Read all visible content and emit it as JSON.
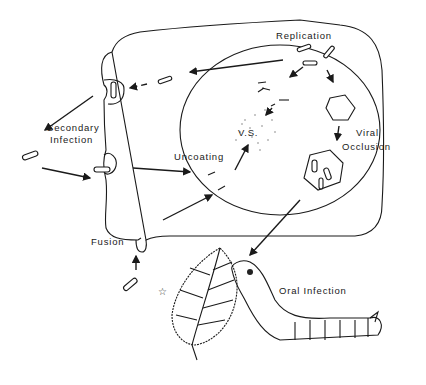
{
  "diagram": {
    "type": "biological-cycle",
    "labels": {
      "replication": "Replication",
      "secondary_infection_1": "Secondary",
      "secondary_infection_2": "Infection",
      "uncoating": "Uncoating",
      "virogenic_stroma": "V.S.",
      "viral_occlusion_1": "Viral",
      "viral_occlusion_2": "Occlusion",
      "fusion": "Fusion",
      "oral_infection": "Oral Infection"
    },
    "nodes": [
      {
        "id": "cell",
        "description": "Host cell outline"
      },
      {
        "id": "nucleus",
        "description": "Nucleus (circle)"
      },
      {
        "id": "vs",
        "description": "Virogenic stroma (stippled)"
      },
      {
        "id": "occlusion-small",
        "description": "Developing occlusion body"
      },
      {
        "id": "occlusion-large",
        "description": "Polyhedral occlusion body with virions"
      },
      {
        "id": "leaf",
        "description": "Leaf"
      },
      {
        "id": "caterpillar",
        "description": "Larva feeding on leaf"
      }
    ],
    "edges": [
      {
        "from": "fusion",
        "to": "uncoating"
      },
      {
        "from": "uncoating",
        "to": "vs"
      },
      {
        "from": "vs",
        "to": "replication"
      },
      {
        "from": "replication",
        "to": "budding"
      },
      {
        "from": "replication",
        "to": "occlusion-small"
      },
      {
        "from": "occlusion-small",
        "to": "occlusion-large"
      },
      {
        "from": "occlusion-large",
        "to": "caterpillar"
      },
      {
        "from": "budding",
        "to": "secondary-infection"
      },
      {
        "from": "secondary-infection",
        "to": "cell"
      }
    ]
  }
}
